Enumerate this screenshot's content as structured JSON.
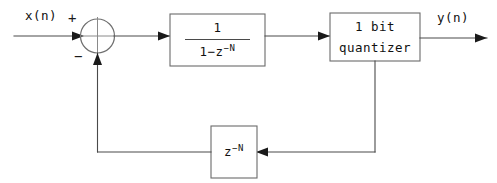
{
  "diagram": {
    "canvas": {
      "width": 497,
      "height": 183,
      "background": "#ffffff"
    },
    "colors": {
      "wire": "#4a4a4a",
      "box_border": "#6b6b6b",
      "arrowhead": "#1a1a1a",
      "text": "#111111",
      "background": "#ffffff"
    },
    "signals": {
      "input_label": "x(n)",
      "output_label": "y(n)"
    },
    "summing_junction": {
      "name": "summing-junction",
      "plus_sign": "+",
      "minus_sign": "−",
      "shape": "circle-with-cross"
    },
    "blocks": [
      {
        "id": "integrator",
        "kind": "transfer-function",
        "numerator": "1",
        "denominator_prefix": "1−z",
        "denominator_exponent": "−N",
        "denominator_full": "1−z⁻N"
      },
      {
        "id": "quantizer",
        "kind": "quantizer",
        "line1": "1 bit",
        "line2": "quantizer"
      },
      {
        "id": "delay",
        "kind": "delay",
        "base": "z",
        "exponent": "−N",
        "full": "z⁻N"
      }
    ]
  }
}
